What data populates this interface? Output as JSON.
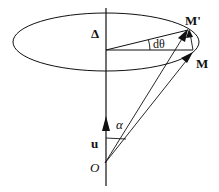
{
  "diagram": {
    "labels": {
      "axis": "Δ",
      "point_m_prime": "M'",
      "point_m": "M",
      "angle_dtheta": "dθ",
      "unit_vector": "u",
      "angle_alpha": "α",
      "origin": "O"
    },
    "colors": {
      "stroke": "#111111",
      "background": "#ffffff"
    }
  }
}
